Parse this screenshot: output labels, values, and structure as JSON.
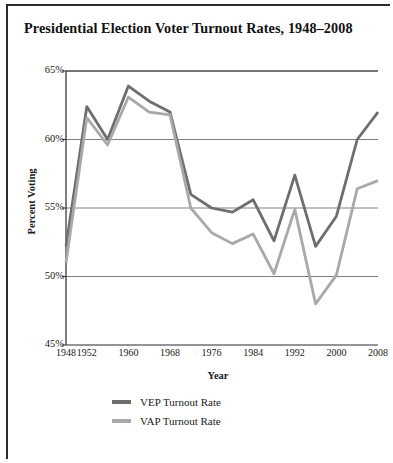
{
  "title": "Presidential Election Voter Turnout Rates, 1948–2008",
  "caption": "",
  "colors": {
    "vep": "#6e6e6e",
    "vap": "#a9a9a9",
    "axis": "#2b2b2b",
    "grid": "#808080",
    "text": "#1a1a1a"
  },
  "legend": [
    {
      "label": "VEP Turnout Rate",
      "color": "#6e6e6e"
    },
    {
      "label": "VAP Turnout Rate",
      "color": "#a9a9a9"
    }
  ],
  "chart_data": {
    "type": "line",
    "title": "Presidential Election Voter Turnout Rates, 1948–2008",
    "xlabel": "Year",
    "ylabel": "Percent Voting",
    "x": [
      1948,
      1952,
      1956,
      1960,
      1964,
      1968,
      1972,
      1976,
      1980,
      1984,
      1988,
      1992,
      1996,
      2000,
      2004,
      2008
    ],
    "tick_labels_x": [
      "1948",
      "1952",
      "1960",
      "1968",
      "1976",
      "1984",
      "1992",
      "2000",
      "2008"
    ],
    "tick_values_x": [
      1948,
      1952,
      1960,
      1968,
      1976,
      1984,
      1992,
      2000,
      2008
    ],
    "tick_labels_y": [
      "45%",
      "50%",
      "55%",
      "60%",
      "65%"
    ],
    "tick_values_y": [
      45,
      50,
      55,
      60,
      65
    ],
    "ylim": [
      45,
      65
    ],
    "xlim": [
      1948,
      2008
    ],
    "grid": true,
    "legend_position": "bottom-left",
    "series": [
      {
        "name": "VEP Turnout Rate",
        "color": "#6e6e6e",
        "values": [
          52.2,
          62.4,
          60.0,
          63.9,
          62.8,
          62.0,
          56.0,
          55.0,
          54.7,
          55.6,
          52.6,
          57.4,
          52.2,
          54.4,
          60.0,
          62.0
        ]
      },
      {
        "name": "VAP Turnout Rate",
        "color": "#a9a9a9",
        "values": [
          51.0,
          61.6,
          59.6,
          63.1,
          62.0,
          61.8,
          55.0,
          53.2,
          52.4,
          53.1,
          50.2,
          54.9,
          48.0,
          50.1,
          56.4,
          57.0
        ]
      }
    ]
  }
}
